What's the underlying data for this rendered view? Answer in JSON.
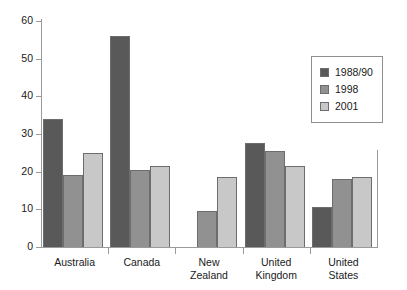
{
  "chart_data": {
    "type": "bar",
    "title": "",
    "subtitle": "",
    "xlabel": "",
    "ylabel": "",
    "ylim": [
      0,
      60
    ],
    "yticks": [
      0,
      10,
      20,
      30,
      40,
      50,
      60
    ],
    "grid": false,
    "legend_position": "top-right",
    "categories": [
      "Australia",
      "Canada",
      "New Zealand",
      "United Kingdom",
      "United States"
    ],
    "category_label_lines": [
      [
        "Australia"
      ],
      [
        "Canada"
      ],
      [
        "New",
        "Zealand"
      ],
      [
        "United",
        "Kingdom"
      ],
      [
        "United",
        "States"
      ]
    ],
    "series": [
      {
        "name": "1988/90",
        "color": "#595959",
        "values": [
          34,
          56,
          null,
          27.5,
          10.5
        ]
      },
      {
        "name": "1998",
        "color": "#919191",
        "values": [
          19,
          20.5,
          9.5,
          25.5,
          18
        ]
      },
      {
        "name": "2001",
        "color": "#c8c8c8",
        "values": [
          25,
          21.5,
          18.5,
          21.5,
          18.7
        ]
      }
    ]
  },
  "legend": {
    "entries": [
      {
        "label": "1988/90",
        "color": "#595959"
      },
      {
        "label": "1998",
        "color": "#919191"
      },
      {
        "label": "2001",
        "color": "#c8c8c8"
      }
    ]
  },
  "axis": {
    "y_tick_labels": [
      "0",
      "10",
      "20",
      "30",
      "40",
      "50",
      "60"
    ]
  }
}
